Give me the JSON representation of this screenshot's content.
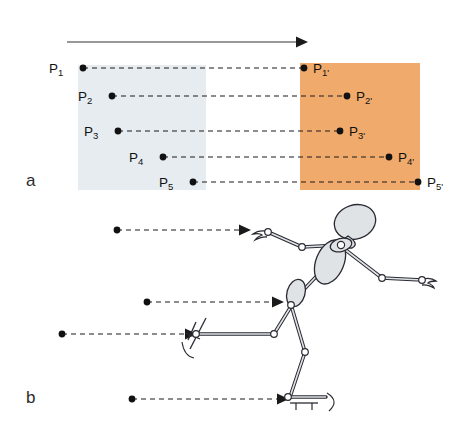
{
  "figure": {
    "panels": [
      {
        "id": "a",
        "label": "a"
      },
      {
        "id": "b",
        "label": "b"
      }
    ]
  },
  "colors": {
    "start_box": "#e6ecf0",
    "end_box": "#f0aa6c",
    "line": "#1a1a1a",
    "dash": "#1a1a1a",
    "limb_fill": "#dfe3e6",
    "limb_stroke": "#2a2a33",
    "background": "#ffffff"
  },
  "panel_a": {
    "direction_arrow": {
      "name": "motion-direction-arrow",
      "x1": 67,
      "y1": 42,
      "x2": 307,
      "y2": 42
    },
    "start_box": {
      "x": 78,
      "y": 65,
      "width": 128,
      "height": 125
    },
    "end_box": {
      "x": 300,
      "y": 63,
      "width": 120,
      "height": 127
    },
    "points": [
      {
        "label": "P",
        "sub": "1",
        "x": 83,
        "y": 68,
        "label_x": 49,
        "label_y": 62
      },
      {
        "label": "P",
        "sub": "2",
        "x": 112,
        "y": 96,
        "label_x": 78,
        "label_y": 90
      },
      {
        "label": "P",
        "sub": "3",
        "x": 118,
        "y": 131,
        "label_x": 84,
        "label_y": 125
      },
      {
        "label": "P",
        "sub": "4",
        "x": 163,
        "y": 157,
        "label_x": 129,
        "label_y": 151
      },
      {
        "label": "P",
        "sub": "5",
        "x": 193,
        "y": 182,
        "label_x": 159,
        "label_y": 176
      }
    ],
    "points_primed": [
      {
        "label": "P",
        "sub": "1'",
        "x": 304,
        "y": 68,
        "label_x": 313,
        "label_y": 62
      },
      {
        "label": "P",
        "sub": "2'",
        "x": 347,
        "y": 96,
        "label_x": 356,
        "label_y": 90
      },
      {
        "label": "P",
        "sub": "3'",
        "x": 340,
        "y": 131,
        "label_x": 349,
        "label_y": 125
      },
      {
        "label": "P",
        "sub": "4'",
        "x": 389,
        "y": 157,
        "label_x": 398,
        "label_y": 151
      },
      {
        "label": "P",
        "sub": "5'",
        "x": 418,
        "y": 182,
        "label_x": 427,
        "label_y": 176
      }
    ],
    "connectors": [
      {
        "name": "connector-p1",
        "x1": 83,
        "y1": 68,
        "x2": 304,
        "y2": 68
      },
      {
        "name": "connector-p2",
        "x1": 112,
        "y1": 96,
        "x2": 347,
        "y2": 96
      },
      {
        "name": "connector-p3",
        "x1": 118,
        "y1": 131,
        "x2": 340,
        "y2": 131
      },
      {
        "name": "connector-p4",
        "x1": 163,
        "y1": 157,
        "x2": 389,
        "y2": 157
      },
      {
        "name": "connector-p5",
        "x1": 193,
        "y1": 182,
        "x2": 418,
        "y2": 182
      }
    ]
  },
  "panel_b": {
    "tracking_arrows": [
      {
        "name": "tracking-arrow-hand",
        "dot_x": 117,
        "dot_y": 230,
        "tip_x": 247,
        "tip_y": 230
      },
      {
        "name": "tracking-arrow-hip",
        "dot_x": 147,
        "dot_y": 302,
        "tip_x": 280,
        "tip_y": 302
      },
      {
        "name": "tracking-arrow-skate",
        "dot_x": 62,
        "dot_y": 334,
        "tip_x": 193,
        "tip_y": 334
      },
      {
        "name": "tracking-arrow-foot",
        "dot_x": 132,
        "dot_y": 399,
        "tip_x": 285,
        "tip_y": 399
      }
    ],
    "joints": [
      {
        "name": "joint-wrist-front",
        "x": 268,
        "y": 232
      },
      {
        "name": "joint-elbow-front",
        "x": 302,
        "y": 247
      },
      {
        "name": "joint-shoulder",
        "x": 341,
        "y": 245
      },
      {
        "name": "joint-elbow-back",
        "x": 382,
        "y": 278
      },
      {
        "name": "joint-wrist-back",
        "x": 422,
        "y": 280
      },
      {
        "name": "joint-hip",
        "x": 290,
        "y": 306
      },
      {
        "name": "joint-knee-front",
        "x": 274,
        "y": 334
      },
      {
        "name": "joint-ankle-front",
        "x": 194,
        "y": 334
      },
      {
        "name": "joint-knee-back",
        "x": 305,
        "y": 352
      },
      {
        "name": "joint-ankle-back",
        "x": 290,
        "y": 397
      }
    ]
  }
}
